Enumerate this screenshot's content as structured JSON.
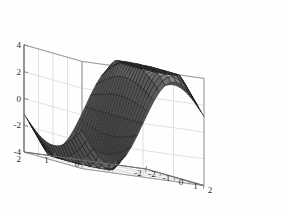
{
  "figure": {
    "background_color": "#fefefe",
    "type": "3d-surface-plot",
    "width": 286,
    "height": 216
  },
  "chart_data": {
    "type": "surface",
    "title": "",
    "xlabel": "",
    "ylabel": "",
    "zlabel": "",
    "surface_function": "saddle",
    "colormap": "gray",
    "shading": "faceted",
    "mesh": {
      "nx": 21,
      "ny": 21,
      "line_color": "#141414"
    },
    "grid": true,
    "box": true,
    "view": {
      "azimuth": -37.5,
      "elevation": 30
    },
    "xlim": [
      -2,
      2
    ],
    "ylim": [
      -2,
      2
    ],
    "zlim": [
      -4,
      4
    ],
    "x_ticks": [
      -2,
      -1,
      0,
      1,
      2
    ],
    "x_tick_labels": [
      "-2",
      "-1",
      "0",
      "1",
      "2"
    ],
    "y_ticks": [
      -2,
      -1,
      0,
      1,
      2
    ],
    "y_tick_labels": [
      "2",
      "1",
      "0",
      "-1",
      "-2"
    ],
    "z_ticks": [
      -4,
      -2,
      0,
      2,
      4
    ],
    "z_tick_labels": [
      "-4",
      "-2",
      "0",
      "2",
      "4"
    ],
    "surface_z_range": [
      -3.6,
      3.6
    ]
  },
  "axes": {
    "z_axis": {
      "name": "z-axis",
      "ticks": [
        {
          "label": "4",
          "value": 4
        },
        {
          "label": "2",
          "value": 2
        },
        {
          "label": "0",
          "value": 0
        },
        {
          "label": "-2",
          "value": -2
        },
        {
          "label": "-4",
          "value": -4
        }
      ]
    },
    "y_axis": {
      "name": "y-axis",
      "ticks": [
        {
          "label": "2",
          "value": 2
        },
        {
          "label": "1",
          "value": 1
        },
        {
          "label": "0",
          "value": 0
        },
        {
          "label": "-1",
          "value": -1
        },
        {
          "label": "-2",
          "value": -2
        }
      ]
    },
    "x_axis": {
      "name": "x-axis",
      "ticks": [
        {
          "label": "-2",
          "value": -2
        },
        {
          "label": "-1",
          "value": -1
        },
        {
          "label": "0",
          "value": 0
        },
        {
          "label": "1",
          "value": 1
        },
        {
          "label": "2",
          "value": 2
        }
      ]
    }
  },
  "colors": {
    "surface_dark": "#1c1c1c",
    "surface_mid": "#4a4a4a",
    "surface_light": "#8d8d8d",
    "mesh": "#141414",
    "grid": "#d4d4d4",
    "axis": "#9a9a9a",
    "text": "#2b2b2b",
    "background": "#fefefe"
  }
}
